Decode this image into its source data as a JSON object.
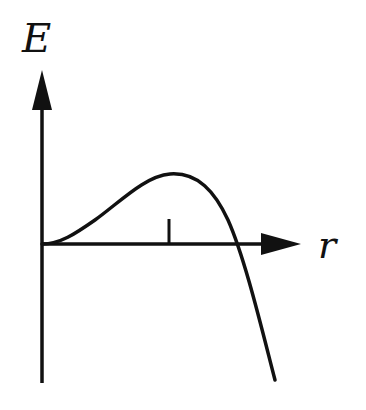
{
  "diagram": {
    "type": "energy-vs-distance sketch",
    "y_axis_label": "E",
    "x_axis_label": "r",
    "colors": {
      "line": "#111111",
      "background": "#ffffff"
    },
    "curve": {
      "description": "Rises from origin to a maximum, then falls steeply below the r-axis",
      "points": [
        [
          42,
          244
        ],
        [
          60,
          240
        ],
        [
          90,
          222
        ],
        [
          130,
          192
        ],
        [
          170,
          174
        ],
        [
          200,
          184
        ],
        [
          225,
          220
        ],
        [
          245,
          280
        ],
        [
          262,
          340
        ],
        [
          275,
          380
        ]
      ]
    },
    "tick_at_maximum": {
      "x": 169,
      "y_top": 220,
      "y_bottom": 244
    }
  }
}
